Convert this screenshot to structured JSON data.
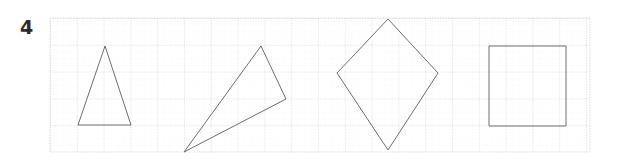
{
  "worksheet": {
    "exercise_number": "4",
    "background_color": "#ffffff",
    "width": 620,
    "height": 164
  },
  "grid": {
    "origin_x": 50,
    "origin_y": 18,
    "right": 590,
    "bottom": 152,
    "major_spacing": 26.8,
    "minor_spacing": 6.7,
    "major_color": "#c9c9c9",
    "minor_color": "#e2e2e2",
    "style": "dotted"
  },
  "shapes": [
    {
      "name": "isosceles-triangle",
      "label": "Isosceles triangle",
      "type": "polygon",
      "stroke": "#6e6e6e",
      "stroke_width": 1,
      "fill": "none",
      "points": "105,46 131,125 78,125"
    },
    {
      "name": "scalene-triangle",
      "label": "Scalene triangle",
      "type": "polygon",
      "stroke": "#6e6e6e",
      "stroke_width": 1,
      "fill": "none",
      "points": "261,46 286,99 184,152"
    },
    {
      "name": "kite-quadrilateral",
      "label": "Kite",
      "type": "polygon",
      "stroke": "#6e6e6e",
      "stroke_width": 1,
      "fill": "none",
      "points": "388,19 438,73 388,150 337,73"
    },
    {
      "name": "square",
      "label": "Square",
      "type": "polygon",
      "stroke": "#6e6e6e",
      "stroke_width": 1,
      "fill": "none",
      "points": "489,46 566,46 566,126 489,126"
    }
  ]
}
